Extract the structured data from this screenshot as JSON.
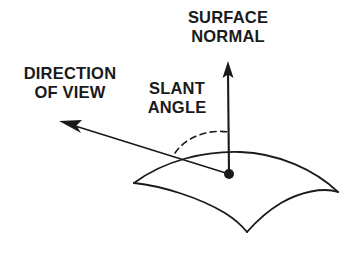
{
  "figure": {
    "background_color": "#ffffff",
    "ink_color": "#1a1a1a",
    "width": 364,
    "height": 255
  },
  "labels": {
    "surface_normal": {
      "line1": "SURFACE",
      "line2": "NORMAL"
    },
    "direction_of_view": {
      "line1": "DIRECTION",
      "line2": "OF VIEW"
    },
    "slant_angle": {
      "line1": "SLANT",
      "line2": "ANGLE"
    }
  },
  "geometry": {
    "surface_point": {
      "x": 229,
      "y": 174
    },
    "normal_arrow": {
      "from_x": 229,
      "from_y": 174,
      "to_x": 228,
      "to_y": 62
    },
    "view_arrow": {
      "from_x": 229,
      "from_y": 174,
      "to_x": 60,
      "to_y": 121
    },
    "slant_arc": {
      "start_x": 175,
      "start_y": 153,
      "end_x": 228,
      "end_y": 132,
      "dashed": true
    },
    "saddle_surface": {
      "left_corner_x": 134,
      "left_corner_y": 183,
      "right_corner_x": 338,
      "right_corner_y": 192,
      "bottom_cusp_x": 247,
      "bottom_cusp_y": 232,
      "ridge_peak_x": 240,
      "ridge_peak_y": 152
    }
  }
}
